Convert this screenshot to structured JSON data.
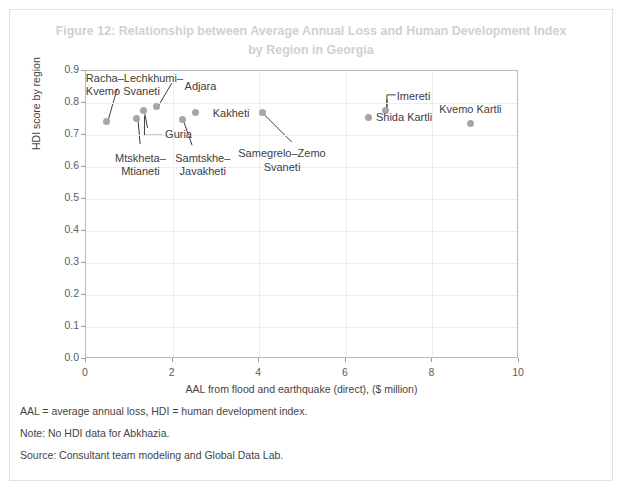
{
  "figure": {
    "title": "Figure 12: Relationship between Average Annual Loss and Human Development Index by Region in Georgia",
    "title_line1": "Figure 12: Relationship between Average Annual Loss and Human Development Index",
    "title_line2": "by Region in Georgia",
    "title_color": "#d0d0d0"
  },
  "footnotes": [
    "AAL = average annual loss, HDI = human development index.",
    "Note: No HDI data for Abkhazia.",
    "Source: Consultant team modeling and Global Data Lab."
  ],
  "chart_data": {
    "type": "scatter",
    "title": "Figure 12: Relationship between Average Annual Loss and Human Development Index by Region in Georgia",
    "xlabel": "AAL from flood and earthquake (direct), ($ million)",
    "ylabel": "HDI score by region",
    "xlim": [
      0,
      10
    ],
    "ylim": [
      0.0,
      0.9
    ],
    "xticks": [
      "0",
      "2",
      "4",
      "6",
      "8",
      "10"
    ],
    "xtick_values": [
      0,
      2,
      4,
      6,
      8,
      10
    ],
    "yticks": [
      "0.0",
      "0.1",
      "0.2",
      "0.3",
      "0.4",
      "0.5",
      "0.6",
      "0.7",
      "0.8",
      "0.9"
    ],
    "ytick_values": [
      0.0,
      0.1,
      0.2,
      0.3,
      0.4,
      0.5,
      0.6,
      0.7,
      0.8,
      0.9
    ],
    "grid": true,
    "legend": "none",
    "marker_color": "#a6a6a6",
    "points": [
      {
        "name": "Racha-Lechkhumi-Kvemo Svaneti",
        "label": "Racha–Lechkhumi–\nKvemo Svaneti",
        "x": 0.5,
        "y": 0.74,
        "label_x": 0.02,
        "label_y": 0.895,
        "label_align": "left",
        "leader": true,
        "leader_to_x": 0.72,
        "leader_to_y": 0.845
      },
      {
        "name": "Mtskheta-Mtianeti",
        "label": "Mtskheta–\nMtianeti",
        "x": 1.2,
        "y": 0.75,
        "label_x": 1.28,
        "label_y": 0.645,
        "label_align": "center",
        "leader": true,
        "leader_to_x": 1.25,
        "leader_to_y": 0.672
      },
      {
        "name": "Guria",
        "label": "Guria",
        "x": 1.35,
        "y": 0.772,
        "label_x": 1.85,
        "label_y": 0.718,
        "label_align": "left",
        "leader": true,
        "leader_to_x": 1.42,
        "leader_to_y": 0.722
      },
      {
        "name": "Adjara",
        "label": "Adjara",
        "x": 1.65,
        "y": 0.786,
        "label_x": 2.3,
        "label_y": 0.868,
        "label_align": "left",
        "leader": true,
        "leader_to_x": 1.98,
        "leader_to_y": 0.862
      },
      {
        "name": "Samtskhe-Javakheti",
        "label": "Samtskhe–\nJavakheti",
        "x": 2.25,
        "y": 0.745,
        "label_x": 2.72,
        "label_y": 0.645,
        "label_align": "center",
        "leader": true,
        "leader_to_x": 2.45,
        "leader_to_y": 0.668
      },
      {
        "name": "Kakheti",
        "label": "Kakheti",
        "x": 2.55,
        "y": 0.767,
        "label_x": 2.95,
        "label_y": 0.785,
        "label_align": "left",
        "leader": false
      },
      {
        "name": "Samegrelo-Zemo Svaneti",
        "label": "Samegrelo–Zemo\nSvaneti",
        "x": 4.1,
        "y": 0.766,
        "label_x": 4.55,
        "label_y": 0.658,
        "label_align": "center",
        "leader": true,
        "leader_to_x": 4.75,
        "leader_to_y": 0.678
      },
      {
        "name": "Shida Kartli",
        "label": "Shida Kartli",
        "x": 6.55,
        "y": 0.752,
        "label_x": 6.72,
        "label_y": 0.772,
        "label_align": "left",
        "leader": false
      },
      {
        "name": "Imereti",
        "label": "Imereti",
        "x": 6.95,
        "y": 0.772,
        "label_x": 7.2,
        "label_y": 0.838,
        "label_align": "left",
        "leader": true,
        "leader_to_x": 6.95,
        "leader_to_y": 0.812
      },
      {
        "name": "Kvemo Kartli",
        "label": "Kvemo Kartli",
        "x": 8.9,
        "y": 0.732,
        "label_x": 8.9,
        "label_y": 0.796,
        "label_align": "center",
        "leader": false
      }
    ]
  }
}
